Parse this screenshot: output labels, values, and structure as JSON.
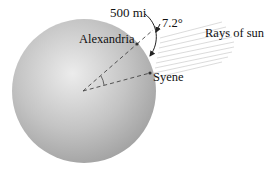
{
  "diagram": {
    "labels": {
      "distance": "500 mi",
      "city_north": "Alexandria",
      "city_south": "Syene",
      "angle": "7.2°",
      "rays": "Rays of sun"
    },
    "colors": {
      "sphere_light": "#e6e6e6",
      "sphere_mid": "#bdbdbd",
      "sphere_dark": "#9a9a9a",
      "lines": "#444444",
      "rays": "#cfcfcf",
      "text": "#111111"
    }
  }
}
